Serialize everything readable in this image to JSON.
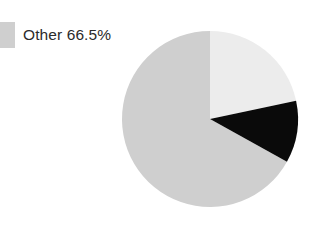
{
  "chart_data": {
    "type": "pie",
    "title": "",
    "labels": [
      "Other",
      "Slice A",
      "Slice B"
    ],
    "values": [
      66.5,
      21.7,
      11.8
    ],
    "value_unit": "%",
    "colors": [
      "#cfcfcf",
      "#ececec",
      "#0a0a0a"
    ],
    "start_angle_deg": 0,
    "direction": "clockwise",
    "legend": {
      "position": "top-left",
      "entries": [
        {
          "label": "Other 66.5%",
          "name": "Other",
          "value": 66.5,
          "color": "#cfcfcf"
        }
      ]
    },
    "slices": [
      {
        "name": "Other",
        "value": 66.5,
        "color": "#cfcfcf",
        "start_deg": 119.0,
        "end_deg": 360.0,
        "labeled_in_legend": true
      },
      {
        "name": "Slice A",
        "value": 21.7,
        "color": "#ececec",
        "start_deg": 0.0,
        "end_deg": 78.0,
        "labeled_in_legend": false
      },
      {
        "name": "Slice B",
        "value": 11.8,
        "color": "#0a0a0a",
        "start_deg": 78.0,
        "end_deg": 119.0,
        "labeled_in_legend": false
      }
    ],
    "geometry": {
      "center_x": 210,
      "center_y": 119,
      "radius": 88
    },
    "background_color": "#ffffff",
    "grid": false,
    "xlabel": "",
    "ylabel": ""
  }
}
